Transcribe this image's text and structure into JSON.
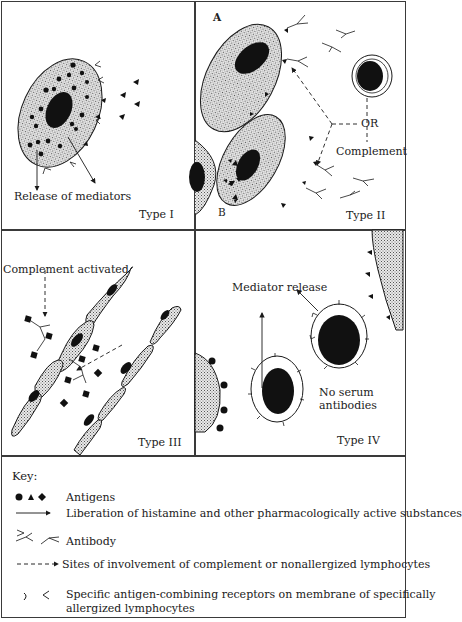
{
  "figure": {
    "panels": [
      {
        "id": "type-1",
        "type_label": "Type I",
        "annotations": [
          "Release of mediators"
        ]
      },
      {
        "id": "type-2",
        "type_label": "Type II",
        "annotations": [
          "A",
          "B",
          "OR",
          "Complement"
        ]
      },
      {
        "id": "type-3",
        "type_label": "Type III",
        "annotations": [
          "Complement activated"
        ]
      },
      {
        "id": "type-4",
        "type_label": "Type IV",
        "annotations": [
          "Mediator release",
          "No serum",
          "antibodies"
        ]
      }
    ],
    "key": {
      "title": "Key:",
      "items": [
        {
          "symbol": "antigen-shapes-icon",
          "label": "Antigens"
        },
        {
          "symbol": "solid-arrow-icon",
          "label": "Liberation of histamine and other pharmacologically active substances"
        },
        {
          "symbol": "antibody-icon",
          "label": "Antibody"
        },
        {
          "symbol": "dashed-arrow-icon",
          "label": "Sites of involvement of complement or nonallergized lymphocytes"
        },
        {
          "symbol": "receptor-icon",
          "label": "Specific antigen-combining receptors on membrane of specifically",
          "label2": "allergized lymphocytes"
        }
      ]
    },
    "colors": {
      "ink": "#1a1a1a",
      "cell_stipple": "#cfcfcf",
      "border": "#3a3a3a",
      "background": "#ffffff"
    }
  }
}
